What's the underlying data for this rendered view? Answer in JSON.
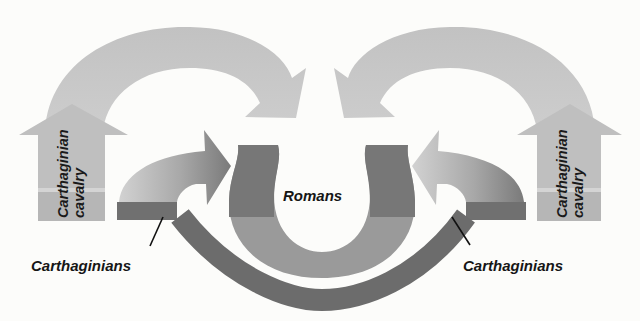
{
  "diagram": {
    "title": "",
    "labels": {
      "romans": "Romans",
      "carthaginians_left": "Carthaginians",
      "carthaginians_right": "Carthaginians",
      "cavalry_left_line1": "Carthaginian",
      "cavalry_left_line2": "cavalry",
      "cavalry_right_line1": "Carthaginian",
      "cavalry_right_line2": "cavalry"
    },
    "colors": {
      "background": "#fcfcfa",
      "cavalry_arrow": "#bdbdbd",
      "cavalry_arrow_light": "#cfcfcf",
      "infantry_arrow_dark": "#7a7a7a",
      "infantry_arrow_light": "#c8c8c8",
      "romans_dark": "#777777",
      "romans_light": "#9c9c9c",
      "carthaginian_line": "#6e6e6e",
      "text": "#161616"
    }
  }
}
